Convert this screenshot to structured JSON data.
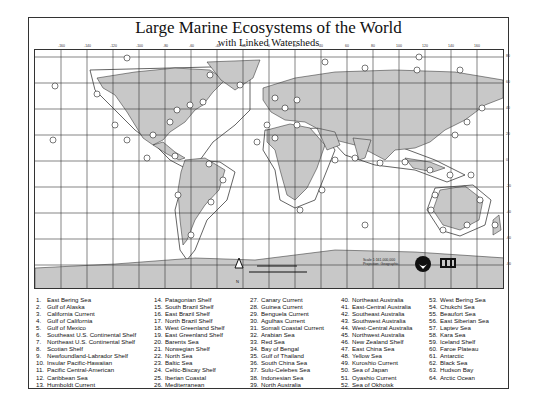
{
  "title": "Large Marine Ecosystems of the World",
  "subtitle": "with Linked Watersheds",
  "map": {
    "longitude_ticks": [
      "-160",
      "-140",
      "-120",
      "-100",
      "-80",
      "-60",
      "-40",
      "-20",
      "0",
      "20",
      "40",
      "60",
      "80",
      "100",
      "120",
      "140",
      "160"
    ],
    "latitude_ticks": [
      "80",
      "60",
      "40",
      "20",
      "0",
      "-20",
      "-40",
      "-60",
      "-80"
    ],
    "scale_text": "Scale 1:161,000,000",
    "projection_text": "Projection: Geographic",
    "north_label": "N",
    "land_color": "#c8c8c8",
    "lme_fill": "#ffffff",
    "grid_color": "#333333"
  },
  "legend": {
    "columns": [
      [
        {
          "n": "1.",
          "name": "East Bering Sea"
        },
        {
          "n": "2.",
          "name": "Gulf of Alaska"
        },
        {
          "n": "3.",
          "name": "California Current"
        },
        {
          "n": "4.",
          "name": "Gulf of California"
        },
        {
          "n": "5.",
          "name": "Gulf of Mexico"
        },
        {
          "n": "6.",
          "name": "Southeast U.S. Continental Shelf"
        },
        {
          "n": "7.",
          "name": "Northeast U.S. Continental Shelf"
        },
        {
          "n": "8.",
          "name": "Scotian Shelf"
        },
        {
          "n": "9.",
          "name": "Newfoundland-Labrador Shelf"
        },
        {
          "n": "10.",
          "name": "Insular Pacific-Hawaiian"
        },
        {
          "n": "11.",
          "name": "Pacific Central-American"
        },
        {
          "n": "12.",
          "name": "Caribbean Sea"
        },
        {
          "n": "13.",
          "name": "Humboldt Current"
        }
      ],
      [
        {
          "n": "14.",
          "name": "Patagonian Shelf"
        },
        {
          "n": "15.",
          "name": "South Brazil Shelf"
        },
        {
          "n": "16.",
          "name": "East Brazil Shelf"
        },
        {
          "n": "17.",
          "name": "North Brazil Shelf"
        },
        {
          "n": "18.",
          "name": "West Greenland Shelf"
        },
        {
          "n": "19.",
          "name": "East Greenland Shelf"
        },
        {
          "n": "20.",
          "name": "Barents Sea"
        },
        {
          "n": "21.",
          "name": "Norwegian Shelf"
        },
        {
          "n": "22.",
          "name": "North Sea"
        },
        {
          "n": "23.",
          "name": "Baltic Sea"
        },
        {
          "n": "24.",
          "name": "Celtic-Biscay Shelf"
        },
        {
          "n": "25.",
          "name": "Iberian Coastal"
        },
        {
          "n": "26.",
          "name": "Mediterranean"
        }
      ],
      [
        {
          "n": "27.",
          "name": "Canary Current"
        },
        {
          "n": "28.",
          "name": "Guinea Current"
        },
        {
          "n": "29.",
          "name": "Benguela Current"
        },
        {
          "n": "30.",
          "name": "Agulhas Current"
        },
        {
          "n": "31.",
          "name": "Somali Coastal Current"
        },
        {
          "n": "32.",
          "name": "Arabian Sea"
        },
        {
          "n": "33.",
          "name": "Red Sea"
        },
        {
          "n": "34.",
          "name": "Bay of Bengal"
        },
        {
          "n": "35.",
          "name": "Gulf of Thailand"
        },
        {
          "n": "36.",
          "name": "South China Sea"
        },
        {
          "n": "37.",
          "name": "Sulu-Celebes Sea"
        },
        {
          "n": "38.",
          "name": "Indonesian Sea"
        },
        {
          "n": "39.",
          "name": "North Australia"
        }
      ],
      [
        {
          "n": "40.",
          "name": "Northeast Australia"
        },
        {
          "n": "41.",
          "name": "East-Central Australia"
        },
        {
          "n": "42.",
          "name": "Southeast Australia"
        },
        {
          "n": "43.",
          "name": "Southwest Australia"
        },
        {
          "n": "44.",
          "name": "West-Central Australia"
        },
        {
          "n": "45.",
          "name": "Northwest Australia"
        },
        {
          "n": "46.",
          "name": "New Zealand Shelf"
        },
        {
          "n": "47.",
          "name": "East China Sea"
        },
        {
          "n": "48.",
          "name": "Yellow Sea"
        },
        {
          "n": "49.",
          "name": "Kuroshio Current"
        },
        {
          "n": "50.",
          "name": "Sea of Japan"
        },
        {
          "n": "51.",
          "name": "Oyashio Current"
        },
        {
          "n": "52.",
          "name": "Sea of Okhotsk"
        }
      ],
      [
        {
          "n": "53.",
          "name": "West Bering Sea"
        },
        {
          "n": "54.",
          "name": "Chukchi Sea"
        },
        {
          "n": "55.",
          "name": "Beaufort Sea"
        },
        {
          "n": "56.",
          "name": "East Siberian Sea"
        },
        {
          "n": "57.",
          "name": "Laptev Sea"
        },
        {
          "n": "58.",
          "name": "Kara Sea"
        },
        {
          "n": "59.",
          "name": "Iceland Shelf"
        },
        {
          "n": "60.",
          "name": "Faroe Plateau"
        },
        {
          "n": "61.",
          "name": "Antarctic"
        },
        {
          "n": "62.",
          "name": "Black Sea"
        },
        {
          "n": "63.",
          "name": "Hudson Bay"
        },
        {
          "n": "64.",
          "name": "Arctic Ocean"
        }
      ]
    ]
  }
}
